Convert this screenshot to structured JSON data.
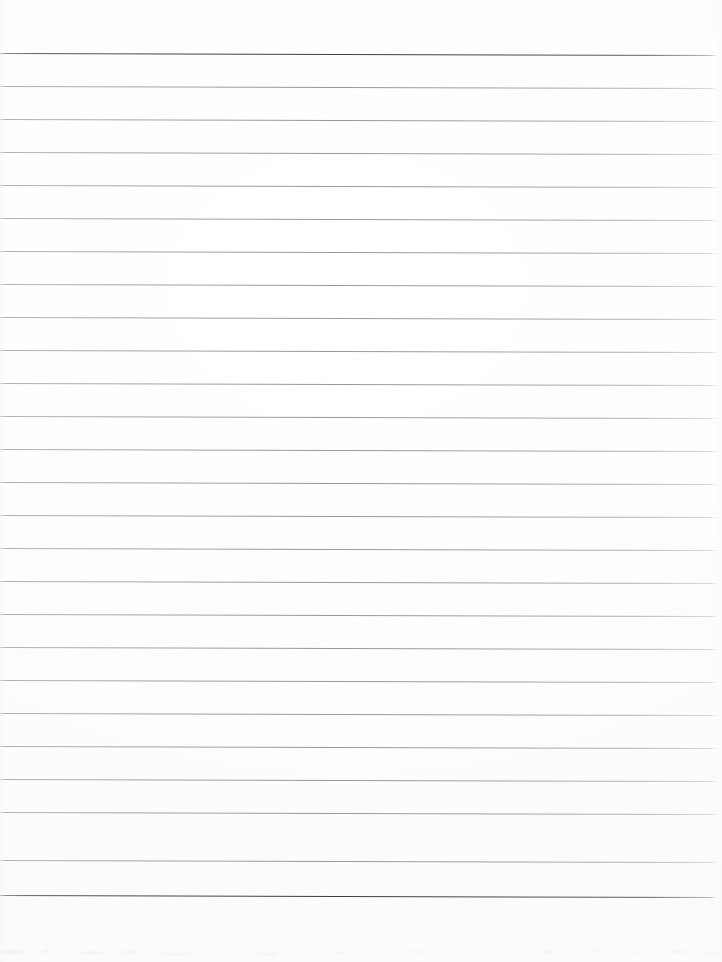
{
  "document": {
    "kind": "scanned-lined-paper",
    "title": "Blank ruled notebook page",
    "width_px": 722,
    "height_px": 962,
    "paper_color": "#fdfdfd",
    "page_background": "#ffffff",
    "written_content": "",
    "written_content_note": "The page is blank — no handwriting, printing, or marks other than the pre-printed ruling."
  },
  "ruling": {
    "style": "wide ruled",
    "line_count": 26,
    "first_line_y": 53,
    "line_spacing_px": 33,
    "line_thickness_px": 1,
    "line_color": "#9a9a9e",
    "heavy_line_color": "#46464a",
    "left_inset_px": 0,
    "right_inset_px": 5,
    "top_margin_px": 53,
    "bottom_margin_px": 67,
    "skew_px_across_width": 2,
    "margin_rule": "none",
    "lines": [
      {
        "index": 1,
        "y": 53,
        "weight": "heavy"
      },
      {
        "index": 2,
        "y": 86,
        "weight": "normal"
      },
      {
        "index": 3,
        "y": 119,
        "weight": "normal"
      },
      {
        "index": 4,
        "y": 152,
        "weight": "normal"
      },
      {
        "index": 5,
        "y": 185,
        "weight": "normal"
      },
      {
        "index": 6,
        "y": 218,
        "weight": "normal"
      },
      {
        "index": 7,
        "y": 251,
        "weight": "normal"
      },
      {
        "index": 8,
        "y": 284,
        "weight": "normal"
      },
      {
        "index": 9,
        "y": 317,
        "weight": "normal"
      },
      {
        "index": 10,
        "y": 350,
        "weight": "normal"
      },
      {
        "index": 11,
        "y": 383,
        "weight": "normal"
      },
      {
        "index": 12,
        "y": 416,
        "weight": "normal"
      },
      {
        "index": 13,
        "y": 449,
        "weight": "normal"
      },
      {
        "index": 14,
        "y": 482,
        "weight": "normal"
      },
      {
        "index": 15,
        "y": 515,
        "weight": "normal"
      },
      {
        "index": 16,
        "y": 548,
        "weight": "normal"
      },
      {
        "index": 17,
        "y": 581,
        "weight": "normal"
      },
      {
        "index": 18,
        "y": 614,
        "weight": "normal"
      },
      {
        "index": 19,
        "y": 647,
        "weight": "normal"
      },
      {
        "index": 20,
        "y": 680,
        "weight": "normal"
      },
      {
        "index": 21,
        "y": 713,
        "weight": "normal"
      },
      {
        "index": 22,
        "y": 746,
        "weight": "normal"
      },
      {
        "index": 23,
        "y": 779,
        "weight": "normal"
      },
      {
        "index": 24,
        "y": 812,
        "weight": "normal"
      },
      {
        "index": 25,
        "y": 860,
        "weight": "normal"
      },
      {
        "index": 26,
        "y": 895,
        "weight": "heavy"
      }
    ]
  },
  "scan_artifacts": {
    "bottom_edge_smudges": true,
    "bottom_edge_smudge_color": "#e9e9eb",
    "edge_vignette": true
  }
}
